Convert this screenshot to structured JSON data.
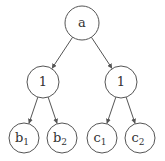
{
  "diagram": {
    "type": "tree",
    "nodes": [
      {
        "id": "root",
        "label": "a",
        "sub": ""
      },
      {
        "id": "left",
        "label": "1",
        "sub": ""
      },
      {
        "id": "right",
        "label": "1",
        "sub": ""
      },
      {
        "id": "b1",
        "label": "b",
        "sub": "1"
      },
      {
        "id": "b2",
        "label": "b",
        "sub": "2"
      },
      {
        "id": "c1",
        "label": "c",
        "sub": "1"
      },
      {
        "id": "c2",
        "label": "c",
        "sub": "2"
      }
    ],
    "edges": [
      {
        "from": "root",
        "to": "left"
      },
      {
        "from": "root",
        "to": "right"
      },
      {
        "from": "left",
        "to": "b1"
      },
      {
        "from": "left",
        "to": "b2"
      },
      {
        "from": "right",
        "to": "c1"
      },
      {
        "from": "right",
        "to": "c2"
      }
    ]
  }
}
